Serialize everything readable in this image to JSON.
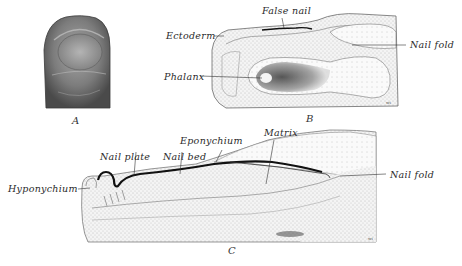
{
  "figure": {
    "panels": [
      {
        "id": "A",
        "letter": "A",
        "description": "external view of fingertip with nail"
      },
      {
        "id": "B",
        "letter": "B",
        "description": "longitudinal section of developing nail"
      },
      {
        "id": "C",
        "letter": "C",
        "description": "longitudinal section of nail later stage"
      }
    ],
    "labels": {
      "false_nail": "False nail",
      "ectoderm": "Ectoderm",
      "nail_fold_b": "Nail fold",
      "phalanx": "Phalanx",
      "eponychium": "Eponychium",
      "matrix": "Matrix",
      "nail_plate": "Nail plate",
      "nail_bed": "Nail bed",
      "hyponychium": "Hyponychium",
      "nail_fold_c": "Nail fold"
    },
    "colors": {
      "background": "#ffffff",
      "ink": "#2a2a2a",
      "tissue": "#bdbdbd",
      "nail": "#111111"
    }
  }
}
